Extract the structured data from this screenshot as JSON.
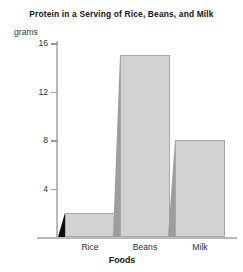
{
  "chart_data": {
    "type": "bar",
    "title": "Protein in a Serving of Rice, Beans, and Milk",
    "categories": [
      "Rice",
      "Beans",
      "Milk"
    ],
    "values": [
      2,
      15,
      8
    ],
    "xlabel": "Foods",
    "ylabel": "grams",
    "ylim": [
      0,
      16
    ],
    "yticks": [
      4,
      8,
      12,
      16
    ],
    "ytick_labels": [
      "4",
      "8",
      "12",
      "16"
    ],
    "grid": false,
    "legend": false,
    "style": "3d-bars",
    "colors": {
      "bar_front": "#d2d2d2",
      "bar_side": "#9d9d9d",
      "rice_bar_side": "#0d0d0d",
      "bar_outline": "#a8a8a8",
      "axis": "#b9b9b9",
      "text": "#141414",
      "background": "#ffffff"
    }
  }
}
